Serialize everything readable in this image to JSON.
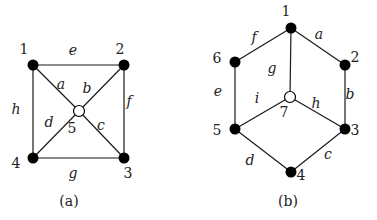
{
  "graphs": [
    {
      "caption": "(a)",
      "nodes": [
        {
          "id": "1",
          "x": 33,
          "y": 65,
          "type": "filled",
          "lx": 24,
          "ly": 54
        },
        {
          "id": "2",
          "x": 124,
          "y": 65,
          "type": "filled",
          "lx": 120,
          "ly": 54
        },
        {
          "id": "3",
          "x": 124,
          "y": 158,
          "type": "filled",
          "lx": 128,
          "ly": 178
        },
        {
          "id": "4",
          "x": 33,
          "y": 158,
          "type": "filled",
          "lx": 16,
          "ly": 168
        },
        {
          "id": "5",
          "x": 79,
          "y": 111,
          "type": "open",
          "lx": 72,
          "ly": 133
        }
      ],
      "edges": [
        {
          "from": "1",
          "to": "2",
          "label": "e",
          "lx": 73,
          "ly": 55
        },
        {
          "from": "2",
          "to": "3",
          "label": "f",
          "lx": 129,
          "ly": 106
        },
        {
          "from": "3",
          "to": "4",
          "label": "g",
          "lx": 73,
          "ly": 178
        },
        {
          "from": "4",
          "to": "1",
          "label": "h",
          "lx": 16,
          "ly": 114
        },
        {
          "from": "1",
          "to": "5",
          "label": "a",
          "lx": 61,
          "ly": 89
        },
        {
          "from": "2",
          "to": "5",
          "label": "b",
          "lx": 87,
          "ly": 93
        },
        {
          "from": "3",
          "to": "5",
          "label": "c",
          "lx": 101,
          "ly": 130
        },
        {
          "from": "4",
          "to": "5",
          "label": "d",
          "lx": 49,
          "ly": 127
        }
      ],
      "caption_x": 69,
      "caption_y": 206
    },
    {
      "caption": "(b)",
      "nodes": [
        {
          "id": "1",
          "x": 291,
          "y": 28,
          "type": "filled",
          "lx": 286,
          "ly": 16
        },
        {
          "id": "2",
          "x": 345,
          "y": 65,
          "type": "filled",
          "lx": 355,
          "ly": 62
        },
        {
          "id": "3",
          "x": 345,
          "y": 129,
          "type": "filled",
          "lx": 355,
          "ly": 135
        },
        {
          "id": "4",
          "x": 291,
          "y": 172,
          "type": "filled",
          "lx": 301,
          "ly": 180
        },
        {
          "id": "5",
          "x": 235,
          "y": 129,
          "type": "filled",
          "lx": 217,
          "ly": 135
        },
        {
          "id": "6",
          "x": 235,
          "y": 62,
          "type": "filled",
          "lx": 217,
          "ly": 63
        },
        {
          "id": "7",
          "x": 290,
          "y": 97,
          "type": "open",
          "lx": 284,
          "ly": 117
        }
      ],
      "edges": [
        {
          "from": "1",
          "to": "2",
          "label": "a",
          "lx": 319,
          "ly": 39
        },
        {
          "from": "2",
          "to": "3",
          "label": "b",
          "lx": 350,
          "ly": 99
        },
        {
          "from": "3",
          "to": "4",
          "label": "c",
          "lx": 328,
          "ly": 159
        },
        {
          "from": "4",
          "to": "5",
          "label": "d",
          "lx": 250,
          "ly": 165
        },
        {
          "from": "5",
          "to": "6",
          "label": "e",
          "lx": 218,
          "ly": 96
        },
        {
          "from": "6",
          "to": "1",
          "label": "f",
          "lx": 254,
          "ly": 42
        },
        {
          "from": "1",
          "to": "7",
          "label": "g",
          "lx": 272,
          "ly": 73
        },
        {
          "from": "3",
          "to": "7",
          "label": "h",
          "lx": 316,
          "ly": 108
        },
        {
          "from": "5",
          "to": "7",
          "label": "i",
          "lx": 257,
          "ly": 103
        }
      ],
      "caption_x": 288,
      "caption_y": 206
    }
  ]
}
